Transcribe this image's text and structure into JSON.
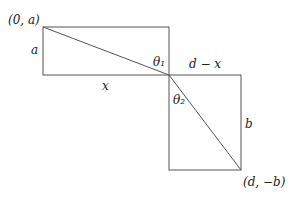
{
  "diagram": {
    "labels": {
      "top_left_point": "(0, a)",
      "left_side": "a",
      "bottom_top_rect": "x",
      "theta1": "θ₁",
      "theta2": "θ₂",
      "top_bottom_rect": "d − x",
      "right_side": "b",
      "bottom_right_point": "(d, −b)"
    },
    "colors": {
      "stroke": "#555555",
      "text": "#222222"
    }
  }
}
